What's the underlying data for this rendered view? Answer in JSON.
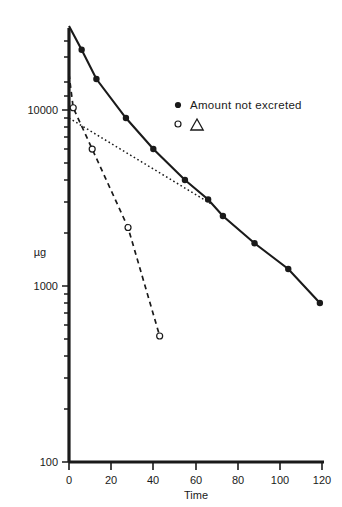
{
  "chart_data": {
    "type": "line",
    "title": "",
    "xlabel": "Time",
    "ylabel": "µg",
    "yscale": "log",
    "xlim": [
      0,
      120
    ],
    "ylim": [
      100,
      40000
    ],
    "grid": false,
    "legend_position": "upper-right-inside",
    "xticks": [
      "0",
      "20",
      "40",
      "60",
      "80",
      "100",
      "120"
    ],
    "xtick_values": [
      0,
      20,
      40,
      60,
      80,
      100,
      120
    ],
    "yticks": [
      "100",
      "1000",
      "10000"
    ],
    "ytick_values": [
      100,
      1000,
      10000
    ],
    "series": [
      {
        "name": "Amount not excreted",
        "marker": "filled-circle",
        "linestyle": "solid",
        "x": [
          0,
          6,
          13,
          27,
          40,
          55,
          66,
          73,
          88,
          104,
          119
        ],
        "y": [
          30000,
          22000,
          15000,
          9000,
          6000,
          4000,
          3100,
          2500,
          1750,
          1250,
          800
        ]
      },
      {
        "name": "Δ",
        "marker": "open-circle",
        "linestyle": "dashed",
        "x": [
          0,
          2,
          11,
          28,
          43
        ],
        "y": [
          16000,
          10300,
          6000,
          2150,
          520
        ]
      },
      {
        "name": "residual-line",
        "marker": "none",
        "linestyle": "dotted",
        "x": [
          0,
          68
        ],
        "y": [
          9000,
          2900
        ]
      }
    ],
    "legend": [
      {
        "marker": "filled-circle",
        "label": "Amount not excreted"
      },
      {
        "marker": "open-circle",
        "label": "Δ"
      }
    ]
  },
  "axes": {
    "x_title": "Time",
    "y_title": "µg"
  }
}
